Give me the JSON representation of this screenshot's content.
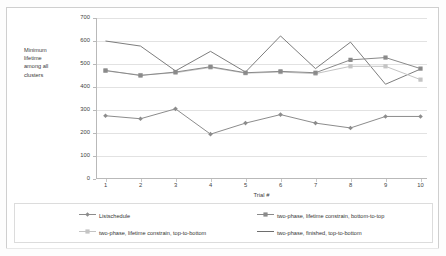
{
  "chart_data": {
    "type": "line",
    "title": "",
    "xlabel": "Trial #",
    "ylabel": "Minimum lifetime among all clusters",
    "x": [
      1,
      2,
      3,
      4,
      5,
      6,
      7,
      8,
      9,
      10
    ],
    "categories": [
      "1",
      "2",
      "3",
      "4",
      "5",
      "6",
      "7",
      "8",
      "9",
      "10"
    ],
    "ylim": [
      0,
      700
    ],
    "yticks": [
      0,
      100,
      200,
      300,
      400,
      500,
      600,
      700
    ],
    "ytick_labels": [
      "0",
      "100",
      "200",
      "300",
      "400",
      "500",
      "600",
      "700"
    ],
    "grid": "horizontal",
    "legend_position": "bottom",
    "series": [
      {
        "name": "Listschedule",
        "marker": "diamond",
        "color": "#8c8c8c",
        "values": [
          275,
          262,
          305,
          195,
          243,
          280,
          243,
          222,
          272,
          272
        ]
      },
      {
        "name": "two-phase, lifetime constrain, bottom-to-top",
        "marker": "square",
        "color": "#8a8a8a",
        "values": [
          472,
          450,
          465,
          488,
          462,
          468,
          462,
          518,
          528,
          480
        ]
      },
      {
        "name": "two-phase, lifetime constrain, top-to-bottom",
        "marker": "square",
        "color": "#c4c4c4",
        "values": [
          470,
          452,
          462,
          485,
          460,
          465,
          458,
          490,
          490,
          432
        ]
      },
      {
        "name": "two-phase, finished, top-to-bottom",
        "marker": "none",
        "color": "#6e6e6e",
        "values": [
          600,
          578,
          470,
          555,
          465,
          622,
          480,
          595,
          412,
          478
        ]
      }
    ]
  },
  "yaxis": {
    "title_lines": [
      "Minimum",
      "lifetime",
      "among all",
      "clusters"
    ],
    "ticks": [
      "700",
      "600",
      "500",
      "400",
      "300",
      "200",
      "100",
      "0"
    ]
  },
  "xaxis": {
    "title": "Trial #",
    "ticks": [
      "1",
      "2",
      "3",
      "4",
      "5",
      "6",
      "7",
      "8",
      "9",
      "10"
    ]
  },
  "legend": {
    "items": [
      {
        "label": "Listschedule",
        "color": "#8c8c8c",
        "marker": "diamond"
      },
      {
        "label": "two-phase, lifetime constrain, bottom-to-top",
        "color": "#8a8a8a",
        "marker": "square"
      },
      {
        "label": "two-phase, lifetime constrain, top-to-bottom",
        "color": "#c4c4c4",
        "marker": "square"
      },
      {
        "label": "two-phase, finished, top-to-bottom",
        "color": "#6e6e6e",
        "marker": "none"
      }
    ]
  }
}
